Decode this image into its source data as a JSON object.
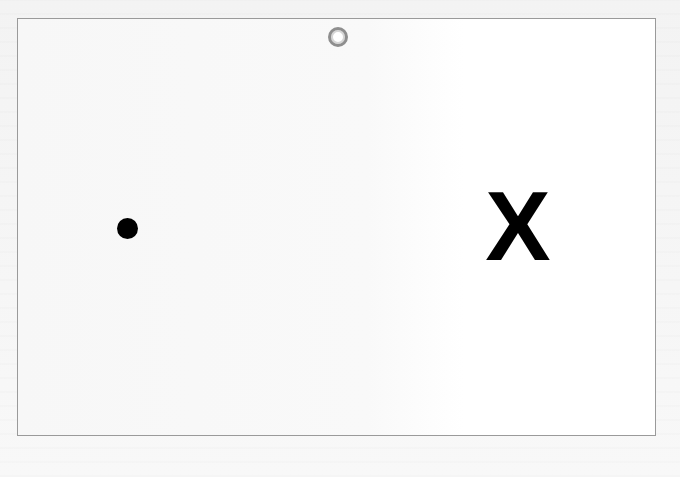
{
  "scene": {
    "background_color": "#f6f6f6",
    "card": {
      "border_color": "#9a9a9a",
      "fill_color": "#ffffff"
    },
    "target_ring": {
      "icon": "ring-icon",
      "outer_color": "#8e8e8e"
    },
    "dot": {
      "icon": "dot-icon",
      "color": "#000000"
    },
    "x_mark": {
      "label": "X",
      "color": "#000000"
    }
  }
}
